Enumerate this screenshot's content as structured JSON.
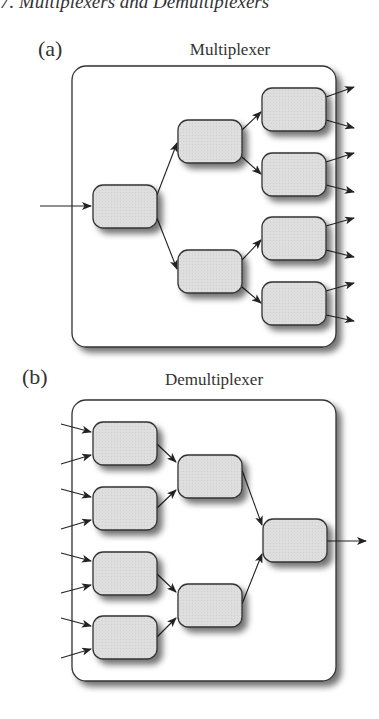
{
  "header": {
    "text": "7.  Multiplexers and Demultiplexers"
  },
  "panels": [
    {
      "label": "(a)",
      "title": "Multiplexer"
    },
    {
      "label": "(b)",
      "title": "Demultiplexer"
    }
  ],
  "colors": {
    "node_fill": "#dcdcdc",
    "node_stroke": "#333333",
    "frame_stroke": "#333333",
    "shadow": "#9a9a9a",
    "arrow": "#222222"
  }
}
